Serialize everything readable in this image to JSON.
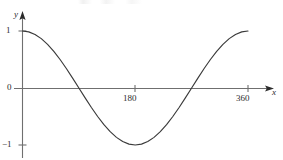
{
  "figure": {
    "background_color": "#ffffff",
    "axis_color": "#6f6f6f",
    "curve_color": "#3a3a3a",
    "text_color": "#2b2b2b"
  },
  "axes": {
    "y_name": "y",
    "x_name": "x",
    "origin_label": "0",
    "y_ticks": [
      {
        "label": "1",
        "value": 1
      },
      {
        "label": "−1",
        "value": -1
      }
    ],
    "x_ticks": [
      {
        "label": "180",
        "value": 180
      },
      {
        "label": "360",
        "value": 360
      }
    ]
  },
  "chart_data": {
    "type": "line",
    "title": "",
    "subtitle": "",
    "xlabel": "x",
    "ylabel": "y",
    "xlim": [
      0,
      360
    ],
    "ylim": [
      -1,
      1
    ],
    "grid": false,
    "legend": null,
    "x_tick_labels": [
      "180",
      "360"
    ],
    "x_tick_values": [
      180,
      360
    ],
    "y_tick_labels": [
      "1",
      "0",
      "−1"
    ],
    "y_tick_values": [
      1,
      0,
      -1
    ],
    "annotations": [],
    "series": [
      {
        "name": "y = cos(x)",
        "function": "cos",
        "units": "degrees",
        "x": [
          0,
          10,
          20,
          30,
          40,
          50,
          60,
          70,
          80,
          90,
          100,
          110,
          120,
          130,
          140,
          150,
          160,
          170,
          180,
          190,
          200,
          210,
          220,
          230,
          240,
          250,
          260,
          270,
          280,
          290,
          300,
          310,
          320,
          330,
          340,
          350,
          360
        ],
        "values": [
          1.0,
          0.985,
          0.94,
          0.866,
          0.766,
          0.643,
          0.5,
          0.342,
          0.174,
          0.0,
          -0.174,
          -0.342,
          -0.5,
          -0.643,
          -0.766,
          -0.866,
          -0.94,
          -0.985,
          -1.0,
          -0.985,
          -0.94,
          -0.866,
          -0.766,
          -0.643,
          -0.5,
          -0.342,
          -0.174,
          0.0,
          0.174,
          0.342,
          0.5,
          0.643,
          0.766,
          0.866,
          0.94,
          0.985,
          1.0
        ],
        "key_points": [
          {
            "x": 0,
            "y": 1,
            "note": "maximum"
          },
          {
            "x": 90,
            "y": 0,
            "note": "zero crossing"
          },
          {
            "x": 180,
            "y": -1,
            "note": "minimum"
          },
          {
            "x": 270,
            "y": 0,
            "note": "zero crossing"
          },
          {
            "x": 360,
            "y": 1,
            "note": "maximum"
          }
        ]
      }
    ]
  }
}
